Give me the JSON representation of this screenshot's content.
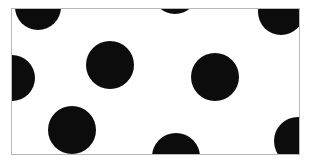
{
  "figure": {
    "type": "illustration",
    "caption": "",
    "width": 311,
    "height": 165
  },
  "canvas": {
    "background_color": "#ffffff",
    "outer_margin_color": "#ffffff"
  },
  "frame": {
    "name": "rectangular-border",
    "x": 11,
    "y": 8,
    "width": 289,
    "height": 147,
    "border_color": "#b8b8b8",
    "border_width": 1,
    "fill_color": "#ffffff"
  },
  "sphere_style": {
    "base_color": "#0c0c0c",
    "shade_color": "#000000",
    "mid_color": "#1c1c1c",
    "rim_color": "#050505",
    "highlight_color": "#ffffff",
    "highlight_offset_x_pct": 32,
    "highlight_offset_y_pct": 27,
    "highlight_radius_pct": 30,
    "count": 9,
    "radius": 23
  },
  "spheres": [
    {
      "id": "sphere-top-left",
      "label": "Sphere 1",
      "cx": 38,
      "cy": 7,
      "r": 23,
      "clipped": "top"
    },
    {
      "id": "sphere-top-center",
      "label": "Sphere 2",
      "cx": 175,
      "cy": -9,
      "r": 23,
      "clipped": "top"
    },
    {
      "id": "sphere-top-right",
      "label": "Sphere 3",
      "cx": 281,
      "cy": 12,
      "r": 23,
      "clipped": "top-right"
    },
    {
      "id": "sphere-left-edge",
      "label": "Sphere 4",
      "cx": 12,
      "cy": 78,
      "r": 23,
      "clipped": "left"
    },
    {
      "id": "sphere-center-left",
      "label": "Sphere 5",
      "cx": 110,
      "cy": 65,
      "r": 24,
      "clipped": "none"
    },
    {
      "id": "sphere-center-right",
      "label": "Sphere 6",
      "cx": 215,
      "cy": 77,
      "r": 24,
      "clipped": "none"
    },
    {
      "id": "sphere-bottom-left",
      "label": "Sphere 7",
      "cx": 72,
      "cy": 130,
      "r": 24,
      "clipped": "none"
    },
    {
      "id": "sphere-bottom-center",
      "label": "Sphere 8",
      "cx": 176,
      "cy": 157,
      "r": 24,
      "clipped": "bottom"
    },
    {
      "id": "sphere-bottom-right",
      "label": "Sphere 9",
      "cx": 298,
      "cy": 141,
      "r": 24,
      "clipped": "right"
    }
  ],
  "chart_data": {
    "type": "scatter",
    "xlabel": "",
    "ylabel": "",
    "xlim": [
      11,
      300
    ],
    "ylim": [
      8,
      155
    ],
    "grid": false,
    "legend": null,
    "marker": "filled-circle-with-specular-highlight",
    "marker_color": "#0c0c0c",
    "marker_radius": 23,
    "points": [
      {
        "x": 38,
        "y": 7
      },
      {
        "x": 175,
        "y": -9
      },
      {
        "x": 281,
        "y": 12
      },
      {
        "x": 12,
        "y": 78
      },
      {
        "x": 110,
        "y": 65
      },
      {
        "x": 215,
        "y": 77
      },
      {
        "x": 72,
        "y": 130
      },
      {
        "x": 176,
        "y": 157
      },
      {
        "x": 298,
        "y": 141
      }
    ],
    "annotations": []
  }
}
